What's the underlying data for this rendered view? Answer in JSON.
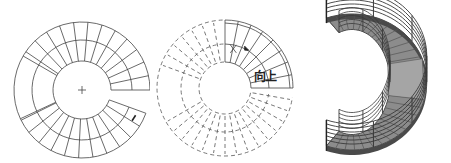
{
  "figure": {
    "panels": [
      {
        "id": "plan-view",
        "kind": "line-drawing",
        "center_mark": "+",
        "tread_count": 28,
        "stroke": "#444444"
      },
      {
        "id": "dashed-plan",
        "kind": "dashed-line-drawing",
        "label": "向上",
        "arrow": "up-direction",
        "stroke": "#555555"
      },
      {
        "id": "3d-render",
        "kind": "rendered-staircase",
        "handrail_color": "#3a3a3a",
        "tread_color": "#8c8c8c",
        "stringer_color": "#4a4a4a"
      }
    ],
    "colors": {
      "background": "#ffffff",
      "line": "#444444"
    }
  }
}
